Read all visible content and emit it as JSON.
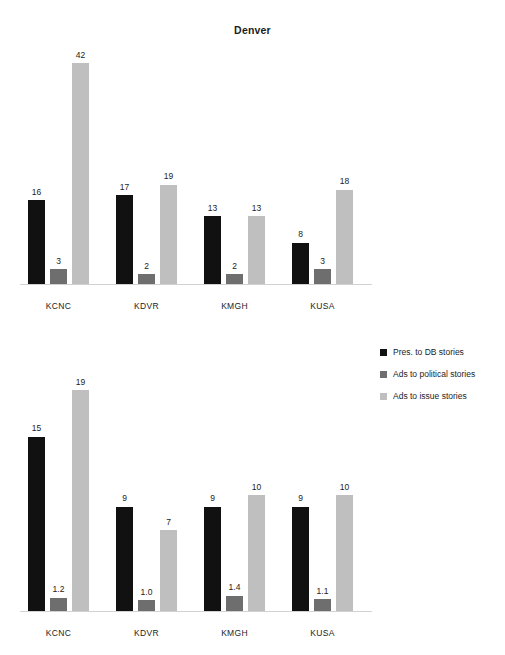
{
  "chart_data": [
    {
      "type": "bar",
      "id": "top",
      "title": "Denver",
      "categories": [
        "KCNC",
        "KDVR",
        "KMGH",
        "KUSA"
      ],
      "series": [
        {
          "name": "Pres. to DB stories",
          "color": "#111111",
          "values": [
            16,
            3,
            42
          ]
        },
        {
          "name": "Ads to political stories",
          "color": "#6e6e6e",
          "values": [
            17,
            2,
            19
          ]
        },
        {
          "name": "Ads to issue stories",
          "color": "#bfbfbf",
          "values": [
            13,
            2,
            13
          ]
        }
      ],
      "grouped_values": [
        {
          "category": "KCNC",
          "values": [
            16,
            3,
            42
          ],
          "labels": [
            "16",
            "3",
            "42"
          ]
        },
        {
          "category": "KDVR",
          "values": [
            17,
            2,
            19
          ],
          "labels": [
            "17",
            "2",
            "19"
          ]
        },
        {
          "category": "KMGH",
          "values": [
            13,
            2,
            13
          ],
          "labels": [
            "13",
            "2",
            "13"
          ]
        },
        {
          "category": "KUSA",
          "values": [
            8,
            3,
            18
          ],
          "labels": [
            "8",
            "3",
            "18"
          ]
        }
      ],
      "xlabel": "",
      "ylabel": "",
      "ylim": [
        0,
        42
      ],
      "grid": false,
      "axis_visible": true
    },
    {
      "type": "bar",
      "id": "bottom",
      "title": "",
      "categories": [
        "KCNC",
        "KDVR",
        "KMGH",
        "KUSA"
      ],
      "series": [
        {
          "name": "Pres. to DB stories",
          "color": "#111111",
          "values": [
            15,
            9,
            9,
            9
          ]
        },
        {
          "name": "Ads to political stories",
          "color": "#6e6e6e",
          "values": [
            1.2,
            1.0,
            1.4,
            1.1
          ]
        },
        {
          "name": "Ads to issue stories",
          "color": "#bfbfbf",
          "values": [
            19,
            7,
            10,
            10
          ]
        }
      ],
      "grouped_values": [
        {
          "category": "KCNC",
          "values": [
            15,
            1.2,
            19
          ],
          "labels": [
            "15",
            "1.2",
            "19"
          ]
        },
        {
          "category": "KDVR",
          "values": [
            9,
            1.0,
            7
          ],
          "labels": [
            "9",
            "1.0",
            "7"
          ]
        },
        {
          "category": "KMGH",
          "values": [
            9,
            1.4,
            10
          ],
          "labels": [
            "9",
            "1.4",
            "10"
          ]
        },
        {
          "category": "KUSA",
          "values": [
            9,
            1.1,
            10
          ],
          "labels": [
            "9",
            "1.1",
            "10"
          ]
        }
      ],
      "xlabel": "",
      "ylabel": "",
      "ylim": [
        0,
        19
      ],
      "grid": false,
      "axis_visible": true
    }
  ],
  "title": "Denver",
  "legend": {
    "position": "middle-right",
    "entries": [
      {
        "label": "Pres. to DB stories",
        "color": "#111111"
      },
      {
        "label": "Ads to political stories",
        "color": "#6e6e6e"
      },
      {
        "label": "Ads to issue stories",
        "color": "#bfbfbf"
      }
    ]
  },
  "colors": {
    "series_black": "#111111",
    "series_mid_gray": "#6e6e6e",
    "series_light_gray": "#bfbfbf",
    "axis": "#d2d2d2",
    "text": "#1c1c1c",
    "background": "#ffffff"
  }
}
